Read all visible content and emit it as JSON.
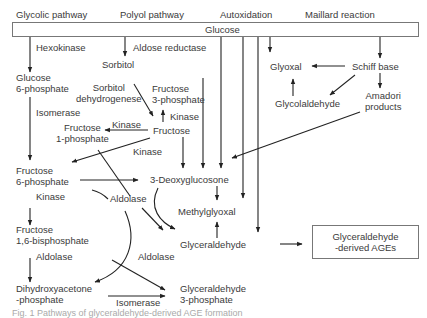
{
  "headers": {
    "glycolic": "Glycolic pathway",
    "polyol": "Polyol pathway",
    "autoxidation": "Autoxidation",
    "maillard": "Maillard reaction"
  },
  "glucose_bar": "Glucose",
  "nodes": {
    "g6p_1": "Glucose",
    "g6p_2": "6-phosphate",
    "sorbitol": "Sorbitol",
    "f3p_1": "Fructose",
    "f3p_2": "3-phosphate",
    "fructose": "Fructose",
    "f1p_1": "Fructose",
    "f1p_2": "1-phosphate",
    "f6p_1": "Fructose",
    "f6p_2": "6-phosphate",
    "f16bp_1": "Fructose",
    "f16bp_2": "1,6-bisphosphate",
    "dhap_1": "Dihydroxyacetone",
    "dhap_2": "-phosphate",
    "g3p_1": "Glyceraldehyde",
    "g3p_2": "3-phosphate",
    "glyceraldehyde": "Glyceraldehyde",
    "methylglyoxal": "Methylglyoxal",
    "deoxyglucosone": "3-Deoxyglucosone",
    "glyoxal": "Glyoxal",
    "schiff": "Schiff base",
    "glycolaldehyde": "Glycolaldehyde",
    "amadori_1": "Amadori",
    "amadori_2": "products",
    "ages_1": "Glyceraldehyde",
    "ages_2": "-derived AGEs"
  },
  "enzymes": {
    "hexokinase": "Hexokinase",
    "aldose_reductase": "Aldose reductase",
    "sorbitol_dh_1": "Sorbitol",
    "sorbitol_dh_2": "dehydrogenese",
    "isomerase_top": "Isomerase",
    "kinase_f3p": "Kinase",
    "kinase_f1p": "Kinase",
    "kinase_f6p": "Kinase",
    "kinase_f16bp": "Kinase",
    "aldolase_mid": "Aldolase",
    "aldolase_left": "Aldolase",
    "aldolase_right": "Aldolase",
    "isomerase_bottom": "Isomerase"
  },
  "caption": "Fig. 1 Pathways of glyceraldehyde-derived AGE formation"
}
